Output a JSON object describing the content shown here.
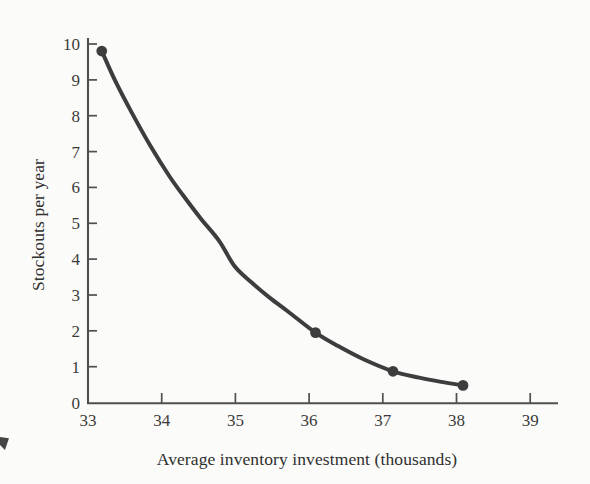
{
  "figure": {
    "background_color": "#fbfbf9",
    "width": 590,
    "height": 484
  },
  "chart_data": {
    "type": "line",
    "title": "",
    "subtitle": "",
    "xlabel": "Average inventory investment (thousands)",
    "ylabel": "Stockouts per year",
    "xlim": [
      33,
      39.4
    ],
    "ylim": [
      0,
      10.2
    ],
    "xticks": [
      33,
      34,
      35,
      36,
      37,
      38,
      39
    ],
    "xtick_labels": [
      "33",
      "34",
      "35",
      "36",
      "37",
      "38",
      "39"
    ],
    "yticks": [
      0,
      1,
      2,
      3,
      4,
      5,
      6,
      7,
      8,
      9,
      10
    ],
    "ytick_labels": [
      "0",
      "1",
      "2",
      "3",
      "4",
      "5",
      "6",
      "7",
      "8",
      "9",
      "10"
    ],
    "grid": false,
    "legend": false,
    "legend_position": "none",
    "line_color": "#3d3d3d",
    "line_width": 4.0,
    "marker": "circle",
    "marker_size": 9,
    "series": [
      {
        "name": "Stockouts vs investment tradeoff curve",
        "markers": [
          {
            "x": 33.22,
            "y": 10.0
          },
          {
            "x": 36.64,
            "y": 2.0
          },
          {
            "x": 37.88,
            "y": 0.9
          },
          {
            "x": 39.0,
            "y": 0.5
          }
        ],
        "curve": [
          {
            "x": 33.22,
            "y": 10.0
          },
          {
            "x": 33.45,
            "y": 9.1
          },
          {
            "x": 33.7,
            "y": 8.25
          },
          {
            "x": 34.0,
            "y": 7.3
          },
          {
            "x": 34.3,
            "y": 6.45
          },
          {
            "x": 34.53,
            "y": 5.88
          },
          {
            "x": 34.8,
            "y": 5.25
          },
          {
            "x": 35.1,
            "y": 4.6
          },
          {
            "x": 35.34,
            "y": 3.9
          },
          {
            "x": 35.6,
            "y": 3.45
          },
          {
            "x": 35.9,
            "y": 3.0
          },
          {
            "x": 36.2,
            "y": 2.6
          },
          {
            "x": 36.64,
            "y": 2.0
          },
          {
            "x": 37.0,
            "y": 1.62
          },
          {
            "x": 37.4,
            "y": 1.25
          },
          {
            "x": 37.88,
            "y": 0.9
          },
          {
            "x": 38.3,
            "y": 0.72
          },
          {
            "x": 38.65,
            "y": 0.6
          },
          {
            "x": 39.0,
            "y": 0.5
          }
        ]
      }
    ]
  },
  "axes": {
    "y_axis": {
      "pixel_x": 88,
      "pixel_top": 38,
      "pixel_bottom": 404,
      "color": "#4f4f4f"
    },
    "x_axis": {
      "pixel_y": 403,
      "pixel_left": 88,
      "pixel_right": 558,
      "color": "#4f4f4f"
    },
    "tick_length": 9
  }
}
